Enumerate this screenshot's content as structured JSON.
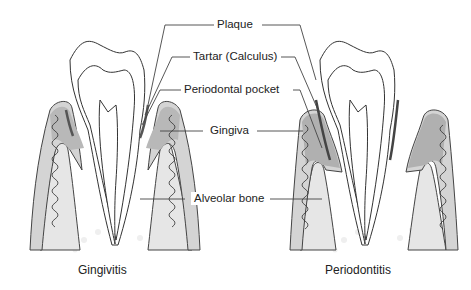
{
  "diagram": {
    "labels": {
      "plaque": "Plaque",
      "tartar": "Tartar (Calculus)",
      "pocket": "Periodontal pocket",
      "gingiva": "Gingiva",
      "bone": "Alveolar bone"
    },
    "captions": {
      "left": "Gingivitis",
      "right": "Periodontitis"
    },
    "colors": {
      "background": "#ffffff",
      "outline": "#333333",
      "gum": "#b8b8b8",
      "bone": "#e6e6e6",
      "dots": "#efefef",
      "leader": "#444444"
    }
  }
}
